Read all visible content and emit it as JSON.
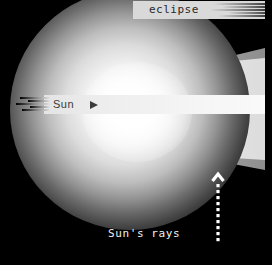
{
  "canvas": {
    "width": 272,
    "height": 265,
    "background": "#000000"
  },
  "diagram": {
    "kind": "solar-eclipse-shadow-diagram",
    "eclipse_label": {
      "text": "eclipse",
      "box_color": "#d9d9d9",
      "text_color": "#2a2a2a",
      "streak_count": 6
    },
    "sun_label": {
      "text": "Sun",
      "arrow_glyph": "triangle-right",
      "bar_color": "#ededed",
      "text_color": "#3a3a3a",
      "streak_count": 5
    },
    "rays_label": {
      "text": "Sun's rays",
      "text_color": "#f2f2f2",
      "arrow_direction": "up",
      "arrow_style": "dotted",
      "arrow_color": "#ffffff",
      "dot_count": 11
    },
    "sun_body": {
      "name": "sun-sphere",
      "center_x": 130,
      "center_y": 110,
      "radius": 118,
      "core_color": "#ffffff",
      "edge_color": "#000000"
    },
    "shadow_cone": {
      "umbra_color": "#e0e0e0",
      "penumbra_color": "#9a9a9a",
      "apex_x": 150,
      "mouth_x": 265,
      "top_edge_y_at_mouth": 54,
      "bottom_edge_y_at_mouth": 166
    }
  }
}
